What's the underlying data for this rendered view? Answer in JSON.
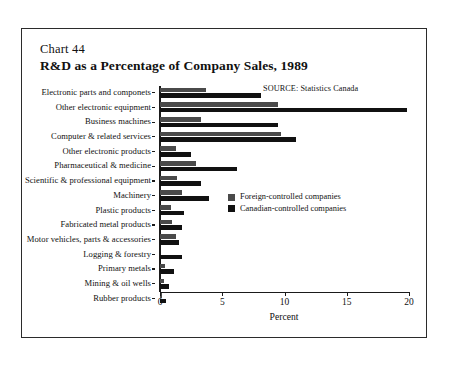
{
  "header": {
    "chart_number": "Chart 44",
    "title": "R&D as a Percentage of Company Sales, 1989",
    "source": "SOURCE:  Statistics Canada"
  },
  "legend": {
    "foreign_label": "Foreign-controlled companies",
    "canadian_label": "Canadian-controlled companies",
    "foreign_color": "#4a4a4a",
    "canadian_color": "#111111"
  },
  "chart_data": {
    "type": "bar",
    "orientation": "horizontal",
    "title": "R&D as a Percentage of Company Sales, 1989",
    "xlabel": "Percent",
    "ylabel": "",
    "xlim": [
      0,
      20
    ],
    "xticks": [
      0,
      5,
      10,
      15,
      20
    ],
    "xtick_labels": [
      "0",
      "5",
      "10",
      "15",
      "20"
    ],
    "grid": false,
    "legend_position": "center-right",
    "categories": [
      "Electronic parts and componets",
      "Other electronic equipment",
      "Business machines",
      "Computer & related services",
      "Other electronic products",
      "Pharmaceutical & medicine",
      "Scientific & professional equipment",
      "Machinery",
      "Plastic products",
      "Fabricated metal products",
      "Motor vehicles, parts & accessories",
      "Logging & forestry",
      "Primary metals",
      "Mining & oil wells",
      "Rubber products"
    ],
    "series": [
      {
        "name": "Foreign-controlled companies",
        "color": "#4a4a4a",
        "values": [
          3.7,
          9.5,
          3.3,
          9.7,
          1.3,
          2.9,
          1.4,
          1.8,
          0.9,
          1.0,
          1.3,
          0.0,
          0.4,
          0.3,
          0.2
        ]
      },
      {
        "name": "Canadian-controlled companies",
        "color": "#111111",
        "values": [
          8.1,
          19.8,
          9.5,
          10.9,
          2.5,
          6.2,
          3.3,
          3.9,
          1.9,
          1.8,
          1.5,
          1.8,
          1.1,
          0.7,
          0.5
        ]
      }
    ]
  }
}
